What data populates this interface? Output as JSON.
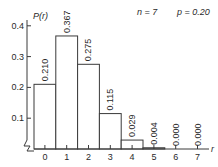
{
  "panel_label": "(a)",
  "annotation": {
    "n_label": "n = 7",
    "p_label": "p = 0.20"
  },
  "chart_data": {
    "type": "bar",
    "title": "",
    "xlabel": "r",
    "ylabel": "P(r)",
    "categories": [
      "0",
      "1",
      "2",
      "3",
      "4",
      "5",
      "6",
      "7"
    ],
    "values": [
      0.21,
      0.367,
      0.275,
      0.115,
      0.029,
      0.004,
      0.0,
      0.0
    ],
    "value_labels": [
      "0.210",
      "0.367",
      "0.275",
      "0.115",
      "0.029",
      "0.004",
      "0.000",
      "0.000"
    ],
    "yticks": [
      "0.1",
      "0.2",
      "0.3",
      "0.4"
    ],
    "ytick_values": [
      0.1,
      0.2,
      0.3,
      0.4
    ],
    "ylim": [
      0,
      0.4
    ],
    "grid": false,
    "legend": null,
    "annotations": [
      "n = 7",
      "p = 0.20"
    ],
    "bar_style": {
      "fill": "#ffffff",
      "stroke": "#3a3a3a"
    }
  }
}
